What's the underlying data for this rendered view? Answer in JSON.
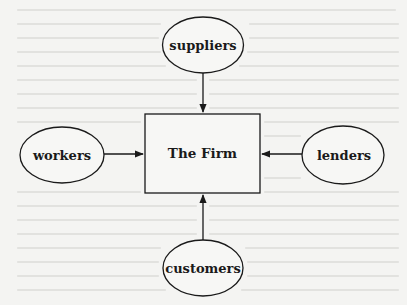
{
  "diagram": {
    "center": {
      "label": "The Firm",
      "shape": "rectangle"
    },
    "nodes": [
      {
        "id": "suppliers",
        "label": "suppliers",
        "shape": "ellipse",
        "position": "top"
      },
      {
        "id": "workers",
        "label": "workers",
        "shape": "ellipse",
        "position": "left"
      },
      {
        "id": "lenders",
        "label": "lenders",
        "shape": "ellipse",
        "position": "right"
      },
      {
        "id": "customers",
        "label": "customers",
        "shape": "ellipse",
        "position": "bottom"
      }
    ],
    "edges": [
      {
        "from": "suppliers",
        "to": "The Firm",
        "direction": "down"
      },
      {
        "from": "workers",
        "to": "The Firm",
        "direction": "right"
      },
      {
        "from": "lenders",
        "to": "The Firm",
        "direction": "left"
      },
      {
        "from": "customers",
        "to": "The Firm",
        "direction": "up"
      }
    ],
    "colors": {
      "stroke": "#1a1a1a",
      "background": "#f4f4f2",
      "fill": "#f7f7f5"
    }
  }
}
